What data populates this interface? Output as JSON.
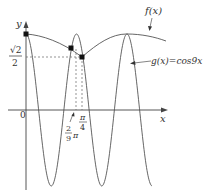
{
  "diagram": {
    "type": "function-graph",
    "axes": {
      "x_label": "x",
      "y_label": "y",
      "origin_label": "0"
    },
    "curves": [
      {
        "name": "f",
        "label": "f(x)",
        "description": "smooth curve passing through (0,1), dipping to touch cos9x near π/4, then rising to touch the next peak of cos9x"
      },
      {
        "name": "g",
        "label": "g(x)=cos9x",
        "expression": "cos9x"
      }
    ],
    "y_marks": [
      {
        "label_num": "√2",
        "label_den": "2",
        "value": "√2/2"
      }
    ],
    "x_marks": [
      {
        "label_num": "2",
        "label_den": "9",
        "suffix": "π",
        "value": "2π/9"
      },
      {
        "label_num": "π",
        "label_den": "4",
        "value": "π/4"
      }
    ],
    "points": [
      {
        "name": "y-intercept",
        "coords": "(0, 1)"
      },
      {
        "name": "intersection-2pi-9",
        "x": "2π/9"
      },
      {
        "name": "intersection-pi-4",
        "coords": "(π/4, √2/2)"
      }
    ],
    "colors": {
      "line": "#555555",
      "text": "#333333",
      "dot": "#111111"
    }
  }
}
